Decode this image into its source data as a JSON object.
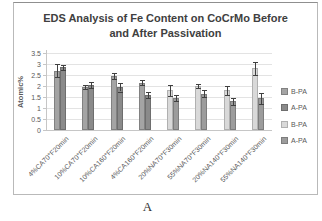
{
  "caption": "A",
  "colors": {
    "grid": "#e3e3e3",
    "axis": "#c6c6c6",
    "tick_text": "#595959",
    "title_text": "#404040",
    "error_bar": "#404040",
    "chart_border": "#b9b9b9",
    "background": "#ffffff"
  },
  "chart_data": {
    "type": "bar",
    "title_lines": [
      "EDS Analysis of Fe Content on CoCrMo Before",
      "and After Passivation"
    ],
    "xlabel": "",
    "ylabel": "Atomic%",
    "ylim": [
      0,
      3.5
    ],
    "yticks": [
      0,
      0.5,
      1,
      1.5,
      2,
      2.5,
      3,
      3.5
    ],
    "grid": true,
    "legend_position": "right",
    "error_bars": true,
    "categories": [
      "4%CA70°F20min",
      "10%CA70°F20min",
      "10%CA160°F20min",
      "4%CA160°F20min",
      "20%NA70°F30min",
      "55%NA70°F30min",
      "20%NA140°F30min",
      "55%NA140°F30min"
    ],
    "series": [
      {
        "name": "B-PA",
        "color": "#a4a4a4",
        "border_color": "#818181",
        "values": [
          2.7,
          1.95,
          2.45,
          2.15,
          null,
          null,
          null,
          null
        ],
        "errors": [
          0.3,
          0.1,
          0.15,
          0.12,
          null,
          null,
          null,
          null
        ]
      },
      {
        "name": "A-PA",
        "color": "#8a8a8a",
        "border_color": "#6e6e6e",
        "values": [
          2.85,
          2.05,
          1.95,
          1.6,
          null,
          null,
          null,
          null
        ],
        "errors": [
          0.12,
          0.12,
          0.2,
          0.15,
          null,
          null,
          null,
          null
        ]
      },
      {
        "name": "B-PA",
        "color": "#d9d9d9",
        "border_color": "#b0b0b0",
        "values": [
          null,
          null,
          null,
          null,
          1.8,
          2.0,
          1.8,
          2.8
        ],
        "errors": [
          null,
          null,
          null,
          null,
          0.25,
          0.1,
          0.2,
          0.3
        ]
      },
      {
        "name": "A-PA",
        "color": "#9c9c9c",
        "border_color": "#7d7d7d",
        "values": [
          null,
          null,
          null,
          null,
          1.45,
          1.65,
          1.3,
          1.45
        ],
        "errors": [
          null,
          null,
          null,
          null,
          0.15,
          0.15,
          0.15,
          0.25
        ]
      }
    ]
  }
}
